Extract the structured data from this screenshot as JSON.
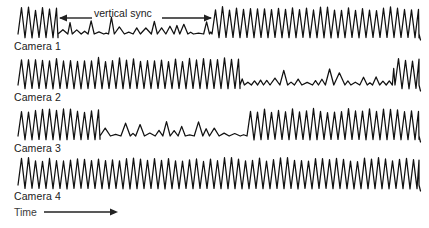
{
  "figure": {
    "background_color": "#ffffff",
    "stroke_color": "#111111",
    "text_color": "#1a1a1a",
    "annotation": {
      "vertical_sync_label": "vertical sync",
      "time_label": "Time",
      "sync_arrow_icon": "double-headed-horizontal-arrow",
      "time_arrow_icon": "right-arrow"
    }
  },
  "traces": [
    {
      "label": "Camera 1"
    },
    {
      "label": "Camera 2"
    },
    {
      "label": "Camera 3"
    },
    {
      "label": "Camera 4"
    }
  ],
  "chart_data": {
    "type": "line",
    "title": "",
    "xlabel": "Time",
    "ylabel": "",
    "grid": false,
    "legend": "none",
    "annotations": [
      {
        "text": "vertical sync",
        "type": "span-arrow",
        "x_start": 58,
        "x_end": 212,
        "y": 18,
        "applies_to": "Camera 1"
      },
      {
        "text": "Time",
        "type": "axis-arrow",
        "x_start": 44,
        "x_end": 118,
        "y": 212
      }
    ],
    "x_range": [
      18,
      420
    ],
    "series": [
      {
        "name": "Camera 1",
        "baseline_y": 34,
        "segments": [
          {
            "state": "high",
            "x_start": 18,
            "x_end": 58,
            "amplitude": 26,
            "period": 7.0,
            "cycles": 6
          },
          {
            "state": "low",
            "x_start": 58,
            "x_end": 212,
            "amplitude": 7,
            "period": 8.0,
            "cycles": 20
          },
          {
            "state": "high",
            "x_start": 212,
            "x_end": 419,
            "amplitude": 26,
            "period": 7.0,
            "cycles": 30
          }
        ]
      },
      {
        "name": "Camera 2",
        "baseline_y": 85,
        "segments": [
          {
            "state": "high",
            "x_start": 18,
            "x_end": 240,
            "amplitude": 26,
            "period": 7.0,
            "cycles": 32
          },
          {
            "state": "low",
            "x_start": 240,
            "x_end": 395,
            "amplitude": 7,
            "period": 8.0,
            "cycles": 20
          },
          {
            "state": "high",
            "x_start": 395,
            "x_end": 419,
            "amplitude": 26,
            "period": 7.0,
            "cycles": 4
          }
        ]
      },
      {
        "name": "Camera 3",
        "baseline_y": 136,
        "segments": [
          {
            "state": "high",
            "x_start": 18,
            "x_end": 100,
            "amplitude": 26,
            "period": 7.0,
            "cycles": 12
          },
          {
            "state": "low",
            "x_start": 100,
            "x_end": 247,
            "amplitude": 7,
            "period": 8.0,
            "cycles": 19
          },
          {
            "state": "high",
            "x_start": 247,
            "x_end": 419,
            "amplitude": 26,
            "period": 7.0,
            "cycles": 25
          }
        ]
      },
      {
        "name": "Camera 4",
        "baseline_y": 185,
        "segments": [
          {
            "state": "high",
            "x_start": 18,
            "x_end": 419,
            "amplitude": 26,
            "period": 7.0,
            "cycles": 58
          }
        ]
      }
    ]
  }
}
